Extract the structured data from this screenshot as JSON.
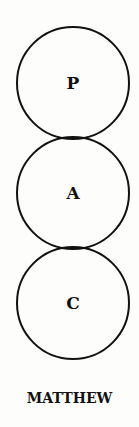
{
  "diagram": {
    "circles": [
      {
        "letter": "P"
      },
      {
        "letter": "A"
      },
      {
        "letter": "C"
      }
    ],
    "label": "MATTHEW"
  }
}
